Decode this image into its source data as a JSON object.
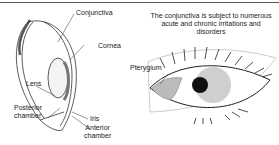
{
  "diagram": {
    "cross_section": {
      "labels": {
        "conjunctiva": "Conjunctiva",
        "cornea": "Cornea",
        "lens": "Lens",
        "posterior_chamber_1": "Posterior",
        "posterior_chamber_2": "chamber",
        "iris": "Iris",
        "anterior_chamber_1": "Anterior",
        "anterior_chamber_2": "chamber"
      }
    },
    "front_view": {
      "caption": "The conjunctiva is subject to numerous acute and chronic irritations and disorders",
      "labels": {
        "pterygium": "Pterygium"
      }
    }
  }
}
